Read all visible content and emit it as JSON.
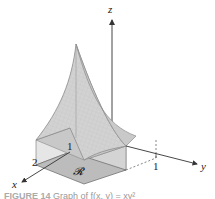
{
  "figure": {
    "axes": {
      "x_label": "x",
      "y_label": "y",
      "z_label": "z"
    },
    "ticks": {
      "x_tick": "2",
      "y_tick": "1",
      "z_tick": "1"
    },
    "region_label": "𝓡",
    "caption": {
      "prefix": "FIGURE 14",
      "text": "Graph of f(x, y) = xy²",
      "note": "caption partially cut off at bottom of screenshot"
    },
    "colors": {
      "surface_fill": "#cfcfcf",
      "surface_edge": "#9a9a9a",
      "region_fill": "#b9b9b9",
      "box_side": "#d8d8d8",
      "axis": "#333333"
    }
  }
}
